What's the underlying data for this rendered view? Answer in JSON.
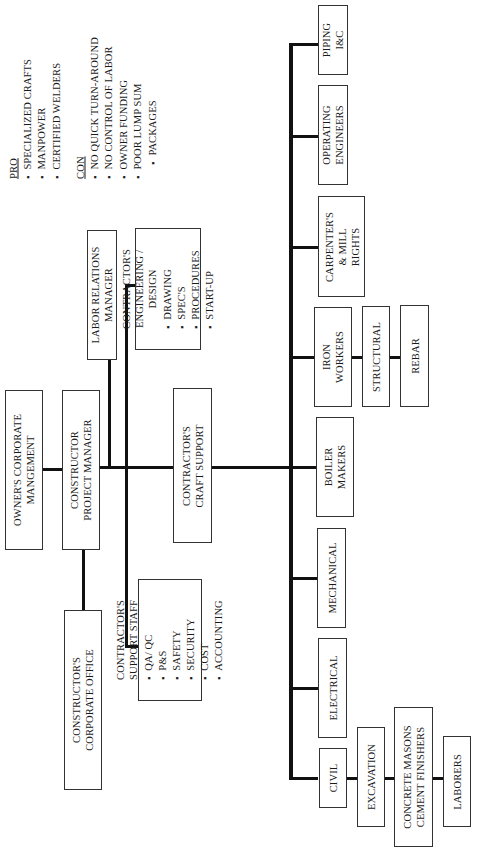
{
  "notes": {
    "pro_label": "PRO",
    "pro_items": [
      "SPECIALIZED CRAFTS",
      "MANPOWER",
      "CERTIFIED WELDERS"
    ],
    "con_label": "CON",
    "con_items": [
      "NO QUICK TURN-AROUND",
      "NO CONTROL OF LABOR",
      "OWNER FUNDING",
      "POOR LUMP SUM",
      "PACKAGES"
    ]
  },
  "nodes": {
    "owner": "OWNER'S CORPORATE MANGEMENT",
    "owner_l1": "OWNER'S CORPORATE",
    "owner_l2": "MANGEMENT",
    "pm_l1": "CONSTRUCTOR",
    "pm_l2": "PROJECT MANAGER",
    "corp_l1": "CONSTRUCTOR'S",
    "corp_l2": "CORPORATE OFFICE",
    "labor_l1": "LABOR RELATIONS",
    "labor_l2": "MANAGER",
    "eng": {
      "title_l1": "CONTRACTOR'S",
      "title_l2": "ENGINEERING /",
      "title_l3": "DESIGN",
      "items": [
        "DRAWING",
        "SPEC'S",
        "PROCEDURES",
        "START-UP"
      ]
    },
    "craft_support_l1": "CONTRACTOR'S",
    "craft_support_l2": "CRAFT SUPPORT",
    "support": {
      "title_l1": "CONTRACTOR'S",
      "title_l2": "SUPPORT STAFF",
      "items": [
        "QA/ QC",
        "P&S",
        "SAFETY",
        "SECURITY",
        "COST",
        "ACCOUNTING"
      ]
    }
  },
  "crafts": [
    {
      "l1": "PIPING",
      "l2": "I&C"
    },
    {
      "l1": "OPERATING",
      "l2": "ENGINEERS"
    },
    {
      "l1": "CARPENTER'S",
      "l2": "& MILL",
      "l3": "RIGHTS"
    },
    {
      "l1": "IRON",
      "l2": "WORKERS"
    },
    {
      "l1": "BOILER",
      "l2": "MAKERS"
    },
    {
      "l1": "MECHANICAL"
    },
    {
      "l1": "ELECTRICAL"
    },
    {
      "l1": "CIVIL"
    }
  ],
  "iron_sub": [
    "STRUCTURAL",
    "REBAR"
  ],
  "civil_sub": {
    "excavation": "EXCAVATION",
    "masons_l1": "CONCRETE MASONS",
    "masons_l2": "CEMENT FINISHERS",
    "laborers": "LABORERS"
  }
}
